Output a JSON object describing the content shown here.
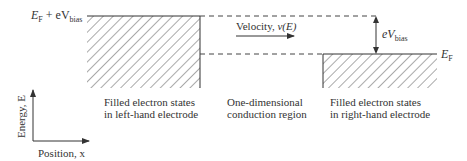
{
  "labels": {
    "ef_plus_bias_main": "E",
    "ef_plus_bias_sub": "F",
    "ef_plus_bias_mid": " + eV",
    "ef_plus_bias_sub2": "bias",
    "velocity": "Velocity, ",
    "velocity_var": "v(E)",
    "bias_main": "eV",
    "bias_sub": "bias",
    "ef_main": "E",
    "ef_sub": "F",
    "left_line1": "Filled electron states",
    "left_line2": "in left-hand electrode",
    "middle_line1": "One-dimensional",
    "middle_line2": "conduction region",
    "right_line1": "Filled electron states",
    "right_line2": "in right-hand electrode",
    "axis_y": "Energy, E",
    "axis_x": "Position, x"
  },
  "colors": {
    "line": "#333333",
    "hatch": "#555555"
  }
}
